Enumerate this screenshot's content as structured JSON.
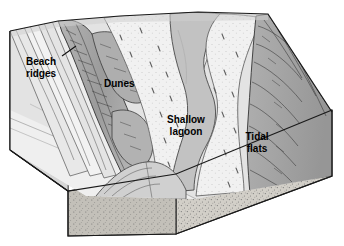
{
  "figure": {
    "type": "block-diagram",
    "background_color": "#ffffff"
  },
  "labels": [
    {
      "id": "beach-ridges",
      "line1": "Beach",
      "line2": "ridges",
      "x": 26,
      "y": 62,
      "has_leader": true
    },
    {
      "id": "dunes",
      "line1": "Dunes",
      "line2": "",
      "x": 104,
      "y": 84,
      "has_leader": false
    },
    {
      "id": "shallow-lagoon",
      "line1": "Shallow",
      "line2": "lagoon",
      "x": 186,
      "y": 120,
      "has_leader": false
    },
    {
      "id": "tidal-flats",
      "line1": "Tidal",
      "line2": "flats",
      "x": 245,
      "y": 137,
      "has_leader": false
    }
  ],
  "palette": {
    "outline": "#1a1a1a",
    "ocean": "#e9e9e9",
    "beach_plain": "#dcdcdc",
    "beach_ridge_light": "#ededed",
    "dune_ridge_dark": "#9e9e9e",
    "dune_field": "#efefef",
    "lagoon_water": "#c4c4c4",
    "tidal_flat": "#f1f1f1",
    "marsh_dark": "#a6a6a6",
    "cross_section_sand": "#d2cfc8",
    "cross_section_side": "#bdbab4",
    "stipple": "#6e6e6e"
  },
  "regions": [
    {
      "name": "ocean-water-plane",
      "tone": "light-gray"
    },
    {
      "name": "beach-ridge-bands",
      "tone": "light-gray",
      "count": 4
    },
    {
      "name": "dune-ridge",
      "tone": "mid-gray"
    },
    {
      "name": "dune-field",
      "tone": "very-light"
    },
    {
      "name": "shallow-lagoon",
      "tone": "mid-gray"
    },
    {
      "name": "tidal-flats",
      "tone": "very-light-stippled"
    },
    {
      "name": "marsh-upland",
      "tone": "mid-dark-gray"
    },
    {
      "name": "cross-section-block",
      "tone": "tan-stippled"
    }
  ]
}
